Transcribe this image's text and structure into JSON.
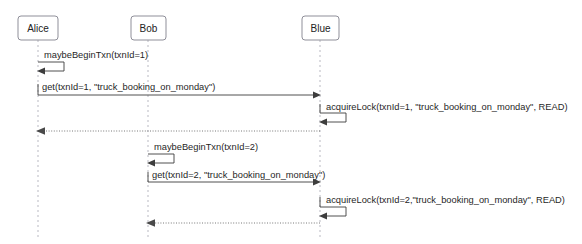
{
  "diagram": {
    "type": "uml-sequence-diagram",
    "title": "",
    "background_color": "#ffffff",
    "line_color": "#3d3d3d",
    "lifeline_color": "#b9b9c2",
    "actor_border_color": "#8f8f99",
    "text_color": "#1f1f1f",
    "participants": [
      {
        "id": "alice",
        "label": "Alice",
        "x": 38
      },
      {
        "id": "bob",
        "label": "Bob",
        "x": 148
      },
      {
        "id": "blue",
        "label": "Blue",
        "x": 320
      }
    ],
    "messages": [
      {
        "index": 1,
        "label": "maybeBeginTxn(txnId=1)",
        "from": "alice",
        "to": "alice",
        "kind": "self-call",
        "style": "solid",
        "y": 62,
        "text_x": 44,
        "text_y": 58
      },
      {
        "index": 2,
        "label": "get(txnId=1, \"truck_booking_on_monday\")",
        "from": "alice",
        "to": "blue",
        "kind": "call",
        "style": "solid",
        "y": 95,
        "text_x": 42,
        "text_y": 90
      },
      {
        "index": 3,
        "label": "acquireLock(txnId=1, \"truck_booking_on_monday\", READ)",
        "from": "blue",
        "to": "blue",
        "kind": "self-call",
        "style": "solid",
        "y": 113,
        "text_x": 326,
        "text_y": 110
      },
      {
        "index": 4,
        "label": "",
        "from": "blue",
        "to": "alice",
        "kind": "return",
        "style": "dashed",
        "y": 131,
        "text_x": 0,
        "text_y": 0
      },
      {
        "index": 5,
        "label": "maybeBeginTxn(txnId=2)",
        "from": "bob",
        "to": "bob",
        "kind": "self-call",
        "style": "solid",
        "y": 154,
        "text_x": 154,
        "text_y": 150
      },
      {
        "index": 6,
        "label": "get(txnId=2, \"truck_booking_on_monday\")",
        "from": "bob",
        "to": "blue",
        "kind": "call",
        "style": "solid",
        "y": 182,
        "text_x": 152,
        "text_y": 178
      },
      {
        "index": 7,
        "label": "acquireLock(txnId=2,\"truck_booking_on_monday\", READ)",
        "from": "blue",
        "to": "blue",
        "kind": "self-call",
        "style": "solid",
        "y": 207,
        "text_x": 326,
        "text_y": 203
      },
      {
        "index": 8,
        "label": "",
        "from": "blue",
        "to": "bob",
        "kind": "return",
        "style": "dashed",
        "y": 223,
        "text_x": 0,
        "text_y": 0
      }
    ]
  }
}
